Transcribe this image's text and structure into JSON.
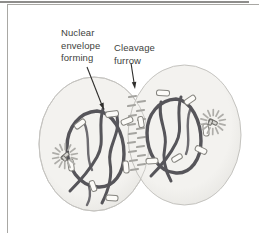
{
  "figure": {
    "type": "biology-diagram",
    "labels": {
      "nuclear_envelope": {
        "lines": [
          "Nuclear",
          "envelope",
          "forming"
        ]
      },
      "cleavage_furrow": {
        "lines": [
          "Cleavage",
          "furrow"
        ]
      }
    },
    "colors": {
      "background": "#ffffff",
      "frame_line": "#8e8d8b",
      "frame_border": "#a9a8a4",
      "cell_fill": "#f3f2ef",
      "cell_fill_edge": "#e4e3df",
      "cell_edge": "#c4c3bf",
      "chromatin": "#56555a",
      "fragment_fill": "#fcfbf8",
      "fragment_outline": "#85847f",
      "aster_ray": "#aeada9",
      "centriole_fill": "#d5d4d0",
      "centriole_outline": "#6f6e6a",
      "midbody_dash": "#a5a4a0",
      "arrow": "#2e2d2b",
      "label_text": "#413f3d"
    }
  }
}
